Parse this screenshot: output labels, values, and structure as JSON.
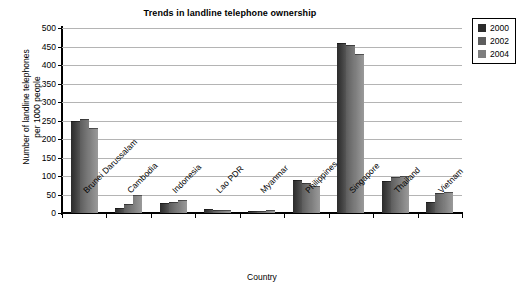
{
  "chart_data": {
    "type": "bar",
    "title": "Trends in landline telephone ownership",
    "xlabel": "Country",
    "ylabel": "Number of landline telephones per 1000 people",
    "ylabel_line1": "Number of landline telephones",
    "ylabel_line2": "per 1000 people",
    "ylim": [
      0,
      500
    ],
    "ytick_step": 50,
    "yticks": [
      500,
      450,
      400,
      350,
      300,
      250,
      200,
      150,
      100,
      50,
      0
    ],
    "grid": true,
    "legend_position": "right",
    "categories": [
      "Brunei Darussalam",
      "Cambodia",
      "Indonesia",
      "Lao PDR",
      "Myanmar",
      "Philippines",
      "Singapore",
      "Thailand",
      "Vietnam"
    ],
    "series": [
      {
        "name": "2000",
        "color": "#2b2b2b",
        "values": [
          248,
          14,
          28,
          10,
          5,
          88,
          460,
          86,
          30
        ]
      },
      {
        "name": "2002",
        "color": "#5d5d5d",
        "values": [
          254,
          25,
          30,
          9,
          6,
          80,
          453,
          98,
          53
        ]
      },
      {
        "name": "2004",
        "color": "#7e7e7e",
        "values": [
          231,
          49,
          35,
          7,
          7,
          73,
          430,
          99,
          58
        ]
      }
    ]
  },
  "legend": {
    "items": [
      {
        "label": "2000",
        "swatch": "series-swatch-2000"
      },
      {
        "label": "2002",
        "swatch": "series-swatch-2002"
      },
      {
        "label": "2004",
        "swatch": "series-swatch-2004"
      }
    ]
  }
}
